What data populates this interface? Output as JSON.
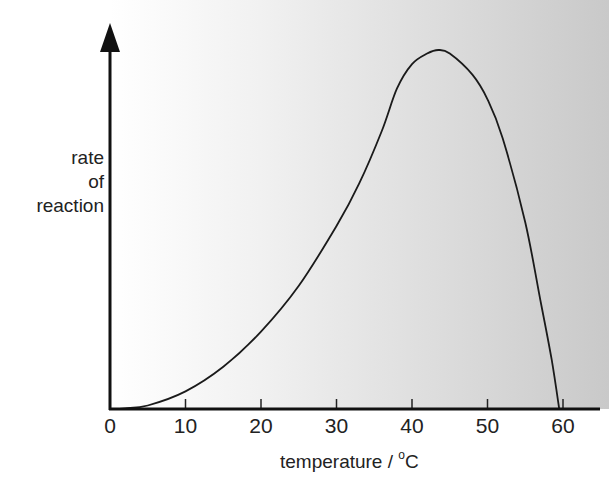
{
  "chart_data": {
    "type": "line",
    "title": "",
    "xlabel": "temperature / °C",
    "xlabel_parts": {
      "text": "temperature / ",
      "sup": "o",
      "unit": "C"
    },
    "ylabel": "rate of reaction",
    "ylabel_lines": [
      "rate",
      "of",
      "reaction"
    ],
    "xlim": [
      0,
      65
    ],
    "ylim": [
      0,
      1.05
    ],
    "x_ticks": [
      0,
      10,
      20,
      30,
      40,
      50,
      60
    ],
    "x_tick_labels": [
      "0",
      "10",
      "20",
      "30",
      "40",
      "50",
      "60"
    ],
    "y_ticks": [],
    "grid": false,
    "legend": null,
    "series": [
      {
        "name": "enzyme activity",
        "x": [
          0,
          2,
          5,
          10,
          15,
          20,
          25,
          30,
          33,
          36,
          38,
          40,
          42,
          43.5,
          45,
          48,
          50,
          52,
          55,
          57,
          58.5,
          59.5
        ],
        "values": [
          0,
          0.002,
          0.01,
          0.05,
          0.12,
          0.22,
          0.35,
          0.52,
          0.64,
          0.79,
          0.91,
          0.98,
          1.01,
          1.02,
          1.01,
          0.95,
          0.88,
          0.77,
          0.53,
          0.31,
          0.14,
          0
        ]
      }
    ],
    "annotations": [],
    "background": "gradient white (left) to light grey (right)"
  }
}
